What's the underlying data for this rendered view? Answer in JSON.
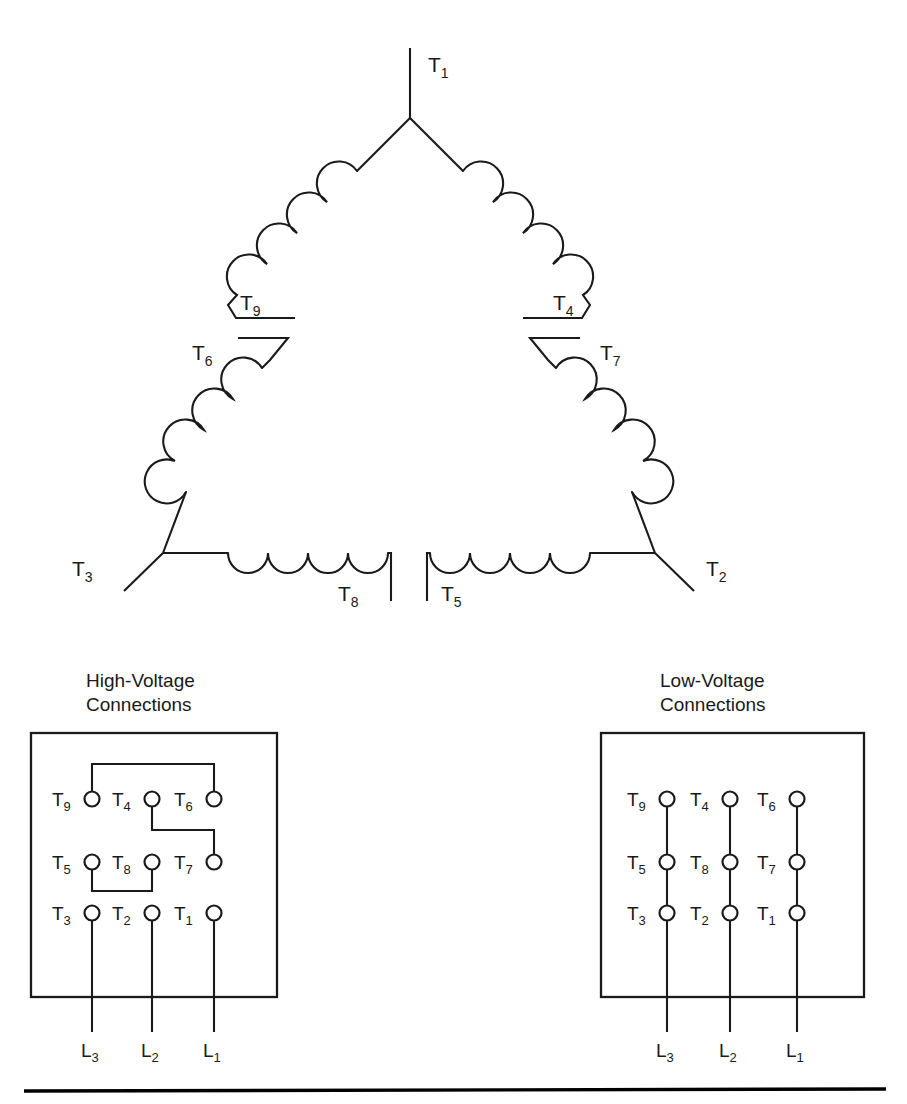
{
  "figure": {
    "type": "electrical-schematic"
  },
  "delta": {
    "terminals": [
      {
        "name": "T1",
        "letter": "T",
        "sub": "1",
        "position": "apex-top"
      },
      {
        "name": "T9",
        "letter": "T",
        "sub": "9",
        "position": "left-upper-lead"
      },
      {
        "name": "T6",
        "letter": "T",
        "sub": "6",
        "position": "left-lower-lead"
      },
      {
        "name": "T4",
        "letter": "T",
        "sub": "4",
        "position": "right-upper-lead"
      },
      {
        "name": "T7",
        "letter": "T",
        "sub": "7",
        "position": "right-lower-lead"
      },
      {
        "name": "T3",
        "letter": "T",
        "sub": "3",
        "position": "left-corner"
      },
      {
        "name": "T2",
        "letter": "T",
        "sub": "2",
        "position": "right-corner"
      },
      {
        "name": "T8",
        "letter": "T",
        "sub": "8",
        "position": "bottom-left-lead"
      },
      {
        "name": "T5",
        "letter": "T",
        "sub": "5",
        "position": "bottom-right-lead"
      }
    ]
  },
  "high_voltage_panel": {
    "title_line1": "High-Voltage",
    "title_line2": "Connections",
    "rows": [
      [
        {
          "letter": "T",
          "sub": "9"
        },
        {
          "letter": "T",
          "sub": "4"
        },
        {
          "letter": "T",
          "sub": "6"
        }
      ],
      [
        {
          "letter": "T",
          "sub": "5"
        },
        {
          "letter": "T",
          "sub": "8"
        },
        {
          "letter": "T",
          "sub": "7"
        }
      ],
      [
        {
          "letter": "T",
          "sub": "3"
        },
        {
          "letter": "T",
          "sub": "2"
        },
        {
          "letter": "T",
          "sub": "1"
        }
      ]
    ],
    "jumpers": [
      {
        "from": "T9",
        "to": "T6",
        "route": "up-over-down"
      },
      {
        "from": "T4",
        "to": "T7",
        "route": "down-right-down"
      },
      {
        "from": "T5",
        "to": "T8",
        "route": "down-under-up"
      }
    ],
    "line_leads": [
      {
        "letter": "L",
        "sub": "3",
        "terminal": "T3"
      },
      {
        "letter": "L",
        "sub": "2",
        "terminal": "T2"
      },
      {
        "letter": "L",
        "sub": "1",
        "terminal": "T1"
      }
    ]
  },
  "low_voltage_panel": {
    "title_line1": "Low-Voltage",
    "title_line2": "Connections",
    "rows": [
      [
        {
          "letter": "T",
          "sub": "9"
        },
        {
          "letter": "T",
          "sub": "4"
        },
        {
          "letter": "T",
          "sub": "6"
        }
      ],
      [
        {
          "letter": "T",
          "sub": "5"
        },
        {
          "letter": "T",
          "sub": "8"
        },
        {
          "letter": "T",
          "sub": "7"
        }
      ],
      [
        {
          "letter": "T",
          "sub": "3"
        },
        {
          "letter": "T",
          "sub": "2"
        },
        {
          "letter": "T",
          "sub": "1"
        }
      ]
    ],
    "jumpers": [
      {
        "column": 1,
        "connects": [
          "T9",
          "T5",
          "T3"
        ],
        "route": "vertical-strap"
      },
      {
        "column": 2,
        "connects": [
          "T4",
          "T8",
          "T2"
        ],
        "route": "vertical-strap"
      },
      {
        "column": 3,
        "connects": [
          "T6",
          "T7",
          "T1"
        ],
        "route": "vertical-strap"
      }
    ],
    "line_leads": [
      {
        "letter": "L",
        "sub": "3",
        "terminal": "T3"
      },
      {
        "letter": "L",
        "sub": "2",
        "terminal": "T2"
      },
      {
        "letter": "L",
        "sub": "1",
        "terminal": "T1"
      }
    ]
  },
  "colors": {
    "ink": "#1a1a1a",
    "background": "#ffffff",
    "rule": "#000000"
  }
}
